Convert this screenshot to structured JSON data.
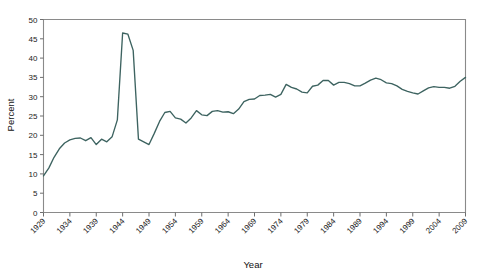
{
  "chart_data": {
    "type": "line",
    "title": "",
    "xlabel": "Year",
    "ylabel": "Percent",
    "xlim": [
      1929,
      2009
    ],
    "ylim": [
      0,
      50
    ],
    "grid": false,
    "legend": false,
    "legend_position": "none",
    "line_color": "#3d6360",
    "frame_color": "#8a8a8a",
    "x_tick_labels": [
      "1929",
      "1934",
      "1939",
      "1944",
      "1949",
      "1954",
      "1959",
      "1964",
      "1969",
      "1974",
      "1979",
      "1984",
      "1989",
      "1994",
      "1999",
      "2004",
      "2009"
    ],
    "x_tick_values": [
      1929,
      1934,
      1939,
      1944,
      1949,
      1954,
      1959,
      1964,
      1969,
      1974,
      1979,
      1984,
      1989,
      1994,
      1999,
      2004,
      2009
    ],
    "y_tick_labels": [
      "0",
      "5",
      "10",
      "15",
      "20",
      "25",
      "30",
      "35",
      "40",
      "45",
      "50"
    ],
    "y_tick_values": [
      0,
      5,
      10,
      15,
      20,
      25,
      30,
      35,
      40,
      45,
      50
    ],
    "series": [
      {
        "name": "Percent",
        "x": [
          1929,
          1930,
          1931,
          1932,
          1933,
          1934,
          1935,
          1936,
          1937,
          1938,
          1939,
          1940,
          1941,
          1942,
          1943,
          1944,
          1945,
          1946,
          1947,
          1948,
          1949,
          1950,
          1951,
          1952,
          1953,
          1954,
          1955,
          1956,
          1957,
          1958,
          1959,
          1960,
          1961,
          1962,
          1963,
          1964,
          1965,
          1966,
          1967,
          1968,
          1969,
          1970,
          1971,
          1972,
          1973,
          1974,
          1975,
          1976,
          1977,
          1978,
          1979,
          1980,
          1981,
          1982,
          1983,
          1984,
          1985,
          1986,
          1987,
          1988,
          1989,
          1990,
          1991,
          1992,
          1993,
          1994,
          1995,
          1996,
          1997,
          1998,
          1999,
          2000,
          2001,
          2002,
          2003,
          2004,
          2005,
          2006,
          2007,
          2008,
          2009
        ],
        "values": [
          9.5,
          11.5,
          14.3,
          16.5,
          18.0,
          18.8,
          19.2,
          19.3,
          18.6,
          19.4,
          17.6,
          19.0,
          18.3,
          19.6,
          24.0,
          46.5,
          46.2,
          42.0,
          19.0,
          18.3,
          17.6,
          20.5,
          23.6,
          25.9,
          26.2,
          24.5,
          24.2,
          23.2,
          24.5,
          26.4,
          25.3,
          25.1,
          26.2,
          26.4,
          26.0,
          26.1,
          25.6,
          26.8,
          28.7,
          29.3,
          29.4,
          30.3,
          30.4,
          30.6,
          29.9,
          30.6,
          33.2,
          32.4,
          32.0,
          31.2,
          31.0,
          32.7,
          33.0,
          34.2,
          34.2,
          33.0,
          33.7,
          33.7,
          33.4,
          32.8,
          32.8,
          33.5,
          34.3,
          34.8,
          34.4,
          33.6,
          33.4,
          32.8,
          31.9,
          31.4,
          31.0,
          30.7,
          31.5,
          32.3,
          32.6,
          32.4,
          32.4,
          32.2,
          32.7,
          34.0,
          35.0
        ]
      }
    ]
  },
  "axes": {
    "x_title": "Year",
    "y_title": "Percent"
  }
}
